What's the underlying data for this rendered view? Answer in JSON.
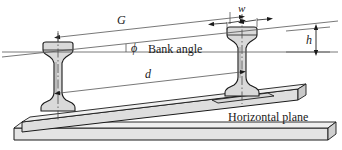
{
  "figure": {
    "labels": {
      "gauge": "G",
      "rail_center_distance": "d",
      "rail_head_width": "w",
      "cant_height": "h",
      "bank_angle_symbol": "ϕ",
      "bank_angle_text": "Bank angle",
      "horizontal_plane": "Horizontal plane"
    }
  },
  "colors": {
    "line": "#1a1a1a",
    "thin_line": "#555555",
    "rail_fill": "#d9d9d9",
    "rail_head_fill": "#d2d2d2",
    "slab_fill": "#e4e4e4",
    "slab_fill_dark": "#d0d0d0",
    "background": "#ffffff"
  }
}
